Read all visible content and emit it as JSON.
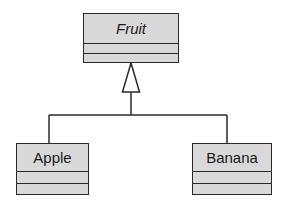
{
  "diagram": {
    "type": "uml-class-diagram",
    "relationship": "generalization",
    "parent": {
      "name": "Fruit",
      "abstract": true,
      "attributes": [],
      "operations": []
    },
    "children": [
      {
        "name": "Apple",
        "attributes": [],
        "operations": []
      },
      {
        "name": "Banana",
        "attributes": [],
        "operations": []
      }
    ]
  },
  "colors": {
    "box_fill": "#d9d9d9",
    "stroke": "#2a2a2a",
    "text": "#1a1a1a",
    "background": "#ffffff"
  }
}
